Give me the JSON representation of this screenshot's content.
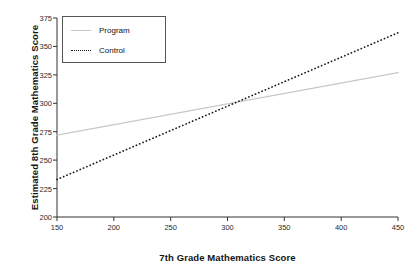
{
  "chart_data": {
    "type": "line",
    "title": "",
    "xlabel": "7th Grade Mathematics Score",
    "ylabel": "Estimated 8th Grade Mathematics Score",
    "xlim": [
      150,
      450
    ],
    "ylim": [
      200,
      375
    ],
    "xticks": [
      150,
      200,
      250,
      300,
      350,
      400,
      450
    ],
    "yticks": [
      200,
      225,
      250,
      275,
      300,
      325,
      350,
      375
    ],
    "grid": false,
    "legend_position": "upper left",
    "series": [
      {
        "name": "Program",
        "style": "solid",
        "color": "#c8c8c8",
        "x": [
          150,
          450
        ],
        "values": [
          272,
          327
        ]
      },
      {
        "name": "Control",
        "style": "dotted",
        "color": "#1a1a1a",
        "x": [
          150,
          450
        ],
        "values": [
          233,
          362
        ]
      }
    ],
    "annotations": [
      {
        "label": "lines-intersect",
        "x": 310,
        "y": 300
      }
    ]
  },
  "legend": {
    "entries": [
      {
        "label": "Program",
        "swatch": "solid-line-swatch"
      },
      {
        "label": "Control",
        "swatch": "dotted-line-swatch"
      }
    ]
  },
  "ytick_labels": [
    "375",
    "350",
    "325",
    "300",
    "275",
    "250",
    "225",
    "200"
  ],
  "xtick_labels": [
    "150",
    "200",
    "250",
    "300",
    "350",
    "400",
    "450"
  ]
}
